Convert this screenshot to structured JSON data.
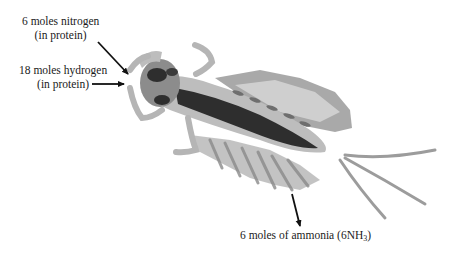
{
  "diagram": {
    "labels": {
      "nitrogen": {
        "line1": "6 moles nitrogen",
        "line2": "(in protein)"
      },
      "hydrogen": {
        "line1": "18 moles hydrogen",
        "line2": "(in protein)"
      },
      "ammonia": {
        "text": "6 moles of ammonia (6NH",
        "subscript": "3",
        "close": ")"
      }
    },
    "arrows": [
      {
        "from": "nitrogen-label",
        "to": "insect-head",
        "direction": "down-right"
      },
      {
        "from": "hydrogen-label",
        "to": "insect-head",
        "direction": "right"
      },
      {
        "from": "insect-abdomen",
        "to": "ammonia-label",
        "direction": "down"
      }
    ],
    "colors": {
      "text": "#1a1a1a",
      "arrow": "#111111",
      "body_dark": "#2e2e2e",
      "body_mid": "#7a7a7a",
      "body_light": "#bdbdbd",
      "body_pale": "#dcdcdc"
    }
  }
}
